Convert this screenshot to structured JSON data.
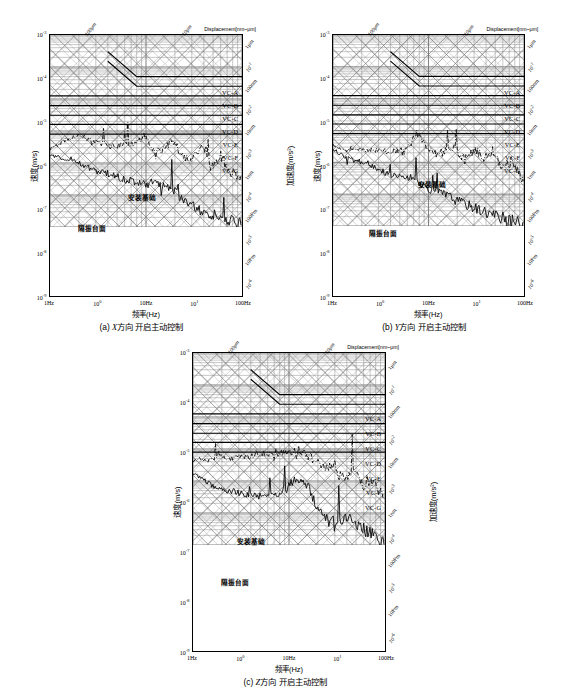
{
  "figure": {
    "panels": [
      {
        "id": "a",
        "caption_prefix": "(a)",
        "caption_axis": "X",
        "caption_text": "方向 开启主动控制",
        "caption_full": "(a) X方向 开启主动控制"
      },
      {
        "id": "b",
        "caption_prefix": "(b)",
        "caption_axis": "Y",
        "caption_text": "方向 开启主动控制",
        "caption_full": "(b) Y方向 开启主动控制"
      },
      {
        "id": "c",
        "caption_prefix": "(c)",
        "caption_axis": "Z",
        "caption_text": "方向 开启主动控制",
        "caption_full": "(c) Z方向 开启主动控制"
      }
    ],
    "axis_titles": {
      "x": "频率(Hz)",
      "y_left": "速度(m/s)",
      "y_right": "加速度(m/s²)",
      "top_right": "Displacement[nm~μm]"
    },
    "top_diagonal_labels": [
      "100μm",
      "10μm"
    ],
    "annotations": [
      {
        "name": "mounting-base",
        "text": "安装基础"
      },
      {
        "name": "isolation-table",
        "text": "隔振台面"
      }
    ],
    "vc_labels": [
      "VC-A",
      "VC-B",
      "VC-C",
      "VC-D",
      "VC-E",
      "VC-F",
      "VC-G"
    ]
  },
  "chart_data": {
    "type": "line",
    "xlabel": "频率(Hz)",
    "ylabel": "速度(m/s)",
    "ylabel_right": "加速度(m/s²)",
    "xscale": "log",
    "yscale": "log",
    "xlim": [
      1,
      100
    ],
    "ylim": [
      1e-09,
      0.001
    ],
    "grid": true,
    "legend_position": "in-plot annotations",
    "x_ticks": [
      {
        "value": 1,
        "label": "1Hz"
      },
      {
        "value": 3.16,
        "label": "10⁰"
      },
      {
        "value": 10,
        "label": "10Hz"
      },
      {
        "value": 31.6,
        "label": "10¹"
      },
      {
        "value": 100,
        "label": "100Hz"
      }
    ],
    "y_ticks_left": [
      {
        "value": 0.001,
        "label": "10⁻³"
      },
      {
        "value": 0.0001,
        "label": "10⁻⁴"
      },
      {
        "value": 1e-05,
        "label": "10⁻⁵"
      },
      {
        "value": 1e-06,
        "label": "10⁻⁶"
      },
      {
        "value": 1e-07,
        "label": "10⁻⁷"
      },
      {
        "value": 1e-08,
        "label": "10⁻⁸"
      },
      {
        "value": 1e-09,
        "label": "10⁻⁹"
      }
    ],
    "y_ticks_right_acceleration": [
      {
        "label": "10⁻¹",
        "pos": 0.14
      },
      {
        "label": "10⁻²",
        "pos": 0.305
      },
      {
        "label": "10⁻³",
        "pos": 0.47
      },
      {
        "label": "10⁻⁴",
        "pos": 0.635
      },
      {
        "label": "10⁻⁵",
        "pos": 0.8
      },
      {
        "label": "10⁻⁶",
        "pos": 0.965
      }
    ],
    "y_ticks_right_displacement": [
      {
        "label": "1μm",
        "pos": 0.055
      },
      {
        "label": "100nm",
        "pos": 0.22
      },
      {
        "label": "10nm",
        "pos": 0.385
      },
      {
        "label": "1nm",
        "pos": 0.55
      },
      {
        "label": "100Pm",
        "pos": 0.715
      },
      {
        "label": "10Pm",
        "pos": 0.88
      }
    ],
    "vc_criteria": [
      {
        "name": "VC-A",
        "velocity_m_s": 5e-05,
        "label": "VC-A",
        "sloped_low_freq": true
      },
      {
        "name": "VC-B",
        "velocity_m_s": 2.5e-05,
        "label": "VC-B",
        "sloped_low_freq": true
      },
      {
        "name": "VC-C",
        "velocity_m_s": 1.25e-05,
        "label": "VC-C",
        "sloped_low_freq": false
      },
      {
        "name": "VC-D",
        "velocity_m_s": 6.2e-06,
        "label": "VC-D",
        "sloped_low_freq": false
      },
      {
        "name": "VC-E",
        "velocity_m_s": 3.1e-06,
        "label": "VC-E",
        "sloped_low_freq": false
      },
      {
        "name": "VC-F",
        "velocity_m_s": 1.6e-06,
        "label": "VC-F",
        "sloped_low_freq": false
      },
      {
        "name": "VC-G",
        "velocity_m_s": 8e-07,
        "label": "VC-G",
        "sloped_low_freq": false
      }
    ],
    "series": [
      {
        "name": "安装基础",
        "name_en": "mounting base",
        "style": "dash-dot",
        "panels": {
          "a": {
            "x": [
              1,
              1.2,
              1.5,
              1.9,
              2.4,
              3,
              3.8,
              4.8,
              6,
              7.5,
              9.5,
              12,
              15,
              19,
              24,
              30,
              38,
              48,
              60,
              75,
              95,
              100
            ],
            "y": [
              3e-07,
              3.5e-07,
              5.5e-07,
              7.5e-07,
              6e-07,
              4.5e-07,
              3.6e-07,
              3.2e-07,
              4.5e-07,
              3.4e-07,
              7.5e-07,
              2.4e-07,
              2.6e-07,
              5.5e-07,
              1.5e-07,
              1.2e-07,
              3e-07,
              7e-08,
              1.6e-07,
              5e-08,
              4e-08,
              3e-08
            ]
          },
          "b": {
            "x": [
              1,
              1.2,
              1.5,
              1.9,
              2.4,
              3,
              3.8,
              4.8,
              6,
              7.5,
              9.5,
              12,
              15,
              19,
              24,
              30,
              38,
              48,
              60,
              75,
              95,
              100
            ],
            "y": [
              3.6e-07,
              2.6e-07,
              2.4e-07,
              2.6e-07,
              2.3e-07,
              2.4e-07,
              2.2e-07,
              2.4e-07,
              2.6e-07,
              8e-07,
              3.2e-07,
              1.8e-07,
              2.2e-07,
              3e-07,
              1.2e-07,
              2.6e-07,
              1.4e-07,
              2.4e-07,
              6e-08,
              1.2e-07,
              3e-08,
              2.4e-08
            ]
          },
          "c": {
            "x": [
              1,
              1.2,
              1.5,
              1.9,
              2.4,
              3,
              3.8,
              4.8,
              6,
              7.5,
              9.5,
              12,
              15,
              19,
              24,
              30,
              38,
              48,
              60,
              75,
              95,
              100
            ],
            "y": [
              4e-07,
              5e-07,
              4.4e-07,
              6e-07,
              5e-07,
              6.5e-07,
              5.5e-07,
              6.5e-07,
              7.5e-07,
              6.5e-07,
              8e-07,
              6e-07,
              7e-07,
              4e-07,
              2.4e-07,
              3.4e-07,
              1.2e-07,
              2e-07,
              7e-08,
              1e-07,
              3e-08,
              2e-08
            ]
          }
        }
      },
      {
        "name": "隔振台面",
        "name_en": "vibration isolation table",
        "style": "solid",
        "panels": {
          "a": {
            "x": [
              1,
              1.3,
              1.7,
              2.2,
              2.8,
              3.6,
              4.6,
              6,
              7.6,
              9.7,
              12,
              16,
              20,
              26,
              33,
              42,
              53,
              68,
              86,
              100
            ],
            "y": [
              1.6e-07,
              1.5e-07,
              1.3e-07,
              9e-08,
              6e-08,
              5e-08,
              4e-08,
              3e-08,
              2.6e-08,
              2.2e-08,
              2.4e-08,
              1.8e-08,
              1.2e-08,
              6e-09,
              4e-09,
              3e-09,
              2.4e-09,
              1.8e-09,
              1.4e-09,
              1.2e-09
            ]
          },
          "b": {
            "x": [
              1,
              1.3,
              1.7,
              2.2,
              2.8,
              3.6,
              4.6,
              6,
              7.6,
              9.7,
              12,
              16,
              20,
              26,
              33,
              42,
              53,
              68,
              86,
              100
            ],
            "y": [
              2.6e-07,
              1.6e-07,
              1.1e-07,
              1e-07,
              7e-08,
              4.5e-08,
              4e-08,
              3.6e-08,
              2.6e-08,
              1.6e-08,
              1.2e-08,
              9e-09,
              6e-09,
              4.5e-09,
              3.4e-09,
              2.6e-09,
              2e-09,
              1.6e-09,
              1.3e-09,
              1.1e-09
            ]
          },
          "c": {
            "x": [
              1,
              1.3,
              1.7,
              2.2,
              2.8,
              3.6,
              4.6,
              6,
              7.6,
              9.7,
              12,
              16,
              20,
              26,
              33,
              42,
              53,
              68,
              86,
              100
            ],
            "y": [
              1.7e-07,
              1.1e-07,
              6e-08,
              5e-08,
              4.4e-08,
              3.6e-08,
              3.4e-08,
              3.6e-08,
              4e-08,
              6e-08,
              1.4e-07,
              6e-08,
              1.2e-08,
              6e-09,
              5e-09,
              8e-09,
              4e-09,
              2.4e-09,
              1.6e-09,
              1.2e-09
            ]
          }
        }
      }
    ]
  }
}
